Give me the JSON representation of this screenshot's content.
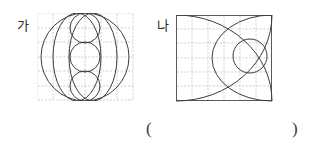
{
  "page": {
    "background": "#ffffff",
    "width": 314,
    "height": 150,
    "line_color": "#3c3c40",
    "grid_color": "#b9b9bd",
    "frame_color": "#5a5a5e"
  },
  "labels": {
    "figure_a": "가",
    "figure_b": "나",
    "paren_open": "(",
    "paren_close": ")"
  },
  "figures": [
    {
      "id": "ga",
      "label": "가",
      "grid": {
        "cols": 6,
        "rows": 6,
        "cell": 16,
        "dashed": true
      },
      "shapes": [
        {
          "type": "circle",
          "name": "large-outer-circle",
          "cx": 48,
          "cy": 44,
          "r": 44
        },
        {
          "type": "ellipse",
          "name": "left-vertical-ellipse",
          "cx": 40,
          "cy": 44,
          "rx": 24,
          "ry": 44
        },
        {
          "type": "ellipse",
          "name": "right-vertical-ellipse",
          "cx": 56,
          "cy": 44,
          "rx": 24,
          "ry": 44
        },
        {
          "type": "circle",
          "name": "top-small-circle",
          "cx": 48,
          "cy": 15,
          "r": 15
        },
        {
          "type": "circle",
          "name": "middle-small-circle",
          "cx": 48,
          "cy": 44,
          "r": 15
        },
        {
          "type": "circle",
          "name": "bottom-small-circle",
          "cx": 48,
          "cy": 73,
          "r": 15
        }
      ]
    },
    {
      "id": "na",
      "label": "나",
      "grid": {
        "cols": 6,
        "rows": 6,
        "cell": 16,
        "dashed": true
      },
      "shapes": [
        {
          "type": "arc",
          "name": "upper-quarter-arc",
          "from": [
            0,
            16
          ],
          "to": [
            80,
            86
          ],
          "rx": 86,
          "ry": 86,
          "sweep": 0
        },
        {
          "type": "arc",
          "name": "lower-quarter-arc",
          "from": [
            0,
            70
          ],
          "to": [
            80,
            0
          ],
          "rx": 86,
          "ry": 86,
          "sweep": 1
        },
        {
          "type": "arc",
          "name": "inner-lens-arc",
          "from": [
            48,
            0
          ],
          "to": [
            48,
            86
          ],
          "rx": 54,
          "ry": 54,
          "sweep": 1
        },
        {
          "type": "circle",
          "name": "right-small-circle",
          "cx": 72,
          "cy": 42,
          "r": 17
        }
      ]
    }
  ]
}
